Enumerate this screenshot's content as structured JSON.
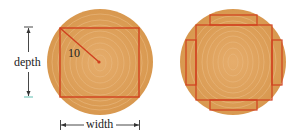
{
  "figure": {
    "left_log": {
      "radius_label": "10",
      "depth_label": "depth",
      "width_label": "width"
    },
    "right_log": {
      "description": "square with four side planks"
    },
    "colors": {
      "wood": "#dc9d5a",
      "wood_ring": "#e8b57c",
      "cut_line": "#d0401e",
      "text": "#222222",
      "arrow": "#333333"
    }
  }
}
